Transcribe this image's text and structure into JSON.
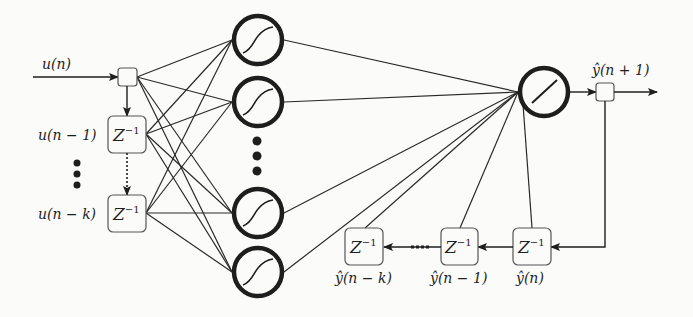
{
  "diagram": {
    "input": {
      "label": "u(n)",
      "delays": [
        {
          "label": "u(n − 1)",
          "operator": "Z",
          "exponent": "−1"
        },
        {
          "label": "u(n − k)",
          "operator": "Z",
          "exponent": "−1"
        }
      ]
    },
    "hidden_layer": {
      "neurons": 4,
      "activation": "sigmoid-icon",
      "ellipsis": "⋮"
    },
    "output_layer": {
      "activation": "linear-icon",
      "label": "ŷ(n + 1)"
    },
    "feedback": {
      "delays": [
        {
          "label": "ŷ(n)",
          "operator": "Z",
          "exponent": "−1"
        },
        {
          "label": "ŷ(n − 1)",
          "operator": "Z",
          "exponent": "−1"
        },
        {
          "label": "ŷ(n − k)",
          "operator": "Z",
          "exponent": "−1"
        }
      ],
      "ellipsis": "····"
    },
    "colors": {
      "stroke": "#1e1e1e",
      "background": "#fbfbfa",
      "box_stroke": "#3a3a3a"
    }
  }
}
